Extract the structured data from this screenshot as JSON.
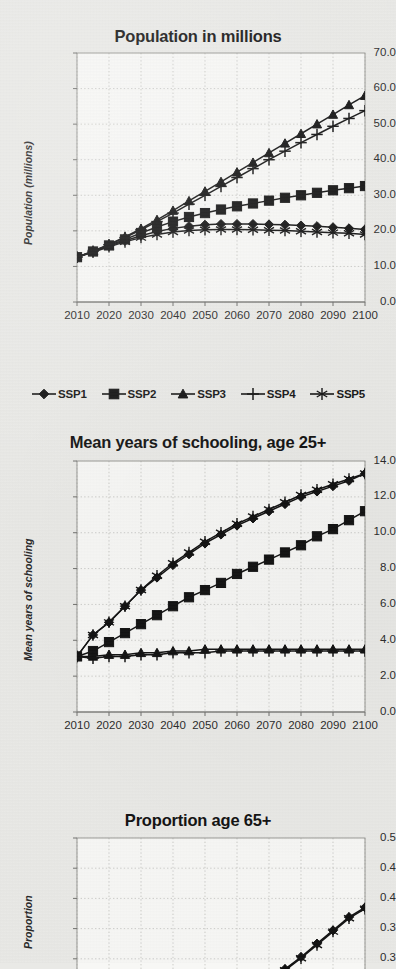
{
  "page": {
    "background_color": "#e9e9e6",
    "ink_color": "#111111",
    "grid_color": "#b9b9b6"
  },
  "charts": [
    {
      "id": "population",
      "title": "Population in millions",
      "ylabel": "Population (millions)",
      "yticks": [
        "70.0",
        "60.0",
        "50.0",
        "40.0",
        "30.0",
        "20.0",
        "10.0",
        "0.0"
      ],
      "xticks": [
        "2010",
        "2020",
        "2030",
        "2040",
        "2050",
        "2060",
        "2070",
        "2080",
        "2090",
        "2100"
      ]
    },
    {
      "id": "schooling",
      "title": "Mean years of schooling, age 25+",
      "ylabel": "Mean years of schooling",
      "yticks": [
        "14.0",
        "12.0",
        "10.0",
        "8.0",
        "6.0",
        "4.0",
        "2.0",
        "0.0"
      ],
      "xticks": [
        "2010",
        "2020",
        "2030",
        "2040",
        "2050",
        "2060",
        "2070",
        "2080",
        "2090",
        "2100"
      ]
    },
    {
      "id": "proportion65",
      "title": "Proportion age 65+",
      "ylabel": "Proportion",
      "yticks": [
        "0.5",
        "0.4",
        "0.4",
        "0.3",
        "0.3"
      ],
      "xticks": []
    }
  ],
  "legend": {
    "items": [
      {
        "label": "SSP1",
        "marker": "diamond-marker"
      },
      {
        "label": "SSP2",
        "marker": "square-marker"
      },
      {
        "label": "SSP3",
        "marker": "triangle-marker"
      },
      {
        "label": "SSP4",
        "marker": "plus-marker"
      },
      {
        "label": "SSP5",
        "marker": "asterisk-marker"
      }
    ]
  },
  "chart_data": [
    {
      "type": "line",
      "title": "Population in millions",
      "xlabel": "",
      "ylabel": "Population (millions)",
      "x": [
        2010,
        2015,
        2020,
        2025,
        2030,
        2035,
        2040,
        2045,
        2050,
        2055,
        2060,
        2065,
        2070,
        2075,
        2080,
        2085,
        2090,
        2095,
        2100
      ],
      "xlim": [
        2010,
        2100
      ],
      "ylim": [
        0.0,
        70.0
      ],
      "ytick_step": 10.0,
      "grid": true,
      "legend_position": "below",
      "series": [
        {
          "name": "SSP1",
          "marker": "diamond",
          "values": [
            12.6,
            14.1,
            15.7,
            17.2,
            18.6,
            19.8,
            20.7,
            21.3,
            21.7,
            21.9,
            21.9,
            21.9,
            21.8,
            21.7,
            21.5,
            21.3,
            21.0,
            20.7,
            20.4
          ]
        },
        {
          "name": "SSP2",
          "marker": "square",
          "values": [
            12.6,
            14.2,
            15.9,
            17.6,
            19.4,
            21.1,
            22.6,
            23.9,
            25.0,
            26.0,
            26.9,
            27.7,
            28.5,
            29.3,
            30.0,
            30.7,
            31.4,
            32.0,
            32.6
          ]
        },
        {
          "name": "SSP3",
          "marker": "triangle",
          "values": [
            12.6,
            14.3,
            16.2,
            18.3,
            20.6,
            23.1,
            25.7,
            28.4,
            31.1,
            33.8,
            36.5,
            39.2,
            41.9,
            44.6,
            47.3,
            50.0,
            52.7,
            55.4,
            58.0
          ]
        },
        {
          "name": "SSP4",
          "marker": "plus",
          "values": [
            12.6,
            14.3,
            16.1,
            18.1,
            20.3,
            22.6,
            25.0,
            27.5,
            30.0,
            32.5,
            35.0,
            37.5,
            40.0,
            42.4,
            44.8,
            47.1,
            49.4,
            51.6,
            53.8
          ]
        },
        {
          "name": "SSP5",
          "marker": "asterisk",
          "values": [
            12.6,
            14.0,
            15.5,
            16.9,
            18.1,
            19.0,
            19.7,
            20.1,
            20.3,
            20.4,
            20.4,
            20.3,
            20.2,
            20.1,
            19.9,
            19.7,
            19.5,
            19.3,
            19.0
          ]
        }
      ]
    },
    {
      "type": "line",
      "title": "Mean years of schooling, age 25+",
      "xlabel": "",
      "ylabel": "Mean years of schooling",
      "x": [
        2010,
        2015,
        2020,
        2025,
        2030,
        2035,
        2040,
        2045,
        2050,
        2055,
        2060,
        2065,
        2070,
        2075,
        2080,
        2085,
        2090,
        2095,
        2100
      ],
      "xlim": [
        2010,
        2100
      ],
      "ylim": [
        0.0,
        14.0
      ],
      "ytick_step": 2.0,
      "grid": true,
      "legend_position": "none",
      "series": [
        {
          "name": "SSP1",
          "marker": "diamond",
          "values": [
            3.1,
            4.3,
            5.0,
            5.9,
            6.8,
            7.5,
            8.2,
            8.8,
            9.4,
            9.9,
            10.4,
            10.8,
            11.2,
            11.6,
            12.0,
            12.3,
            12.6,
            12.9,
            13.3
          ]
        },
        {
          "name": "SSP2",
          "marker": "square",
          "values": [
            3.1,
            3.4,
            3.9,
            4.4,
            4.9,
            5.4,
            5.9,
            6.4,
            6.8,
            7.2,
            7.7,
            8.1,
            8.5,
            8.9,
            9.3,
            9.8,
            10.2,
            10.7,
            11.2
          ]
        },
        {
          "name": "SSP3",
          "marker": "triangle",
          "values": [
            3.1,
            3.1,
            3.2,
            3.2,
            3.3,
            3.3,
            3.4,
            3.4,
            3.5,
            3.5,
            3.5,
            3.5,
            3.5,
            3.5,
            3.5,
            3.5,
            3.5,
            3.5,
            3.5
          ]
        },
        {
          "name": "SSP4",
          "marker": "plus",
          "values": [
            3.1,
            3.0,
            3.1,
            3.1,
            3.2,
            3.2,
            3.3,
            3.3,
            3.3,
            3.4,
            3.4,
            3.4,
            3.4,
            3.4,
            3.4,
            3.4,
            3.4,
            3.4,
            3.4
          ]
        },
        {
          "name": "SSP5",
          "marker": "asterisk",
          "values": [
            3.1,
            4.3,
            5.0,
            5.9,
            6.8,
            7.6,
            8.3,
            8.9,
            9.5,
            10.0,
            10.5,
            10.9,
            11.3,
            11.7,
            12.1,
            12.4,
            12.7,
            13.0,
            13.3
          ]
        }
      ]
    },
    {
      "type": "line",
      "title": "Proportion age 65+",
      "xlabel": "",
      "ylabel": "Proportion",
      "x": [
        2010,
        2015,
        2020,
        2025,
        2030,
        2035,
        2040,
        2045,
        2050,
        2055,
        2060,
        2065,
        2070,
        2075,
        2080,
        2085,
        2090,
        2095,
        2100
      ],
      "xlim": [
        2010,
        2100
      ],
      "ylim": [
        0.25,
        0.5
      ],
      "yticks_numeric": [
        0.5,
        0.45,
        0.4,
        0.35,
        0.3
      ],
      "grid": true,
      "legend_position": "none",
      "note": "panel clipped by bottom of screenshot; only upper portion visible",
      "series": [
        {
          "name": "SSP1",
          "marker": "diamond",
          "values": [
            null,
            null,
            null,
            null,
            null,
            null,
            null,
            null,
            null,
            null,
            null,
            null,
            0.262,
            0.283,
            0.303,
            0.325,
            0.347,
            0.369,
            0.385
          ]
        },
        {
          "name": "SSP5",
          "marker": "asterisk",
          "values": [
            null,
            null,
            null,
            null,
            null,
            null,
            null,
            null,
            null,
            null,
            null,
            null,
            0.26,
            0.281,
            0.301,
            0.323,
            0.345,
            0.367,
            0.383
          ]
        }
      ]
    }
  ]
}
